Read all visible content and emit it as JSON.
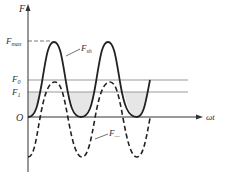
{
  "diagram": {
    "type": "force-vs-angle waveform plot",
    "axes": {
      "y_label": "F",
      "x_label": "ωt",
      "origin_label": "O"
    },
    "levels": {
      "f_max": {
        "label": "F",
        "sub": "max"
      },
      "f0": {
        "label": "F",
        "sub": "0"
      },
      "f1": {
        "label": "F",
        "sub": "1"
      }
    },
    "curves": {
      "solid": {
        "label": "F",
        "sub": "sh",
        "style": "solid"
      },
      "dashed": {
        "label": "F",
        "sub": "—",
        "style": "dashed"
      }
    },
    "colors": {
      "curve": "#222222",
      "level_line": "#999999",
      "shade": "#e6e6e6",
      "axis": "#333333"
    }
  }
}
